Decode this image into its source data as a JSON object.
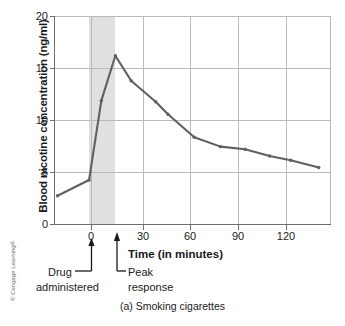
{
  "figure": {
    "caption": "(a) Smoking cigarettes",
    "copyright": "© Cengage Learning®"
  },
  "annotations": {
    "drug_line1": "Drug",
    "drug_line2": "administered",
    "peak_line1": "Peak",
    "peak_line2": "response"
  },
  "colors": {
    "line": "#606060",
    "grid": "#b9b9b9",
    "axis": "#6e6e6e",
    "shade": "#e0e0e0",
    "text": "#1a1a1a"
  },
  "chart_data": {
    "type": "line",
    "title": "(a) Smoking cigarettes",
    "xlabel": "Time (in minutes)",
    "ylabel": "Blood nicotine concentration (ng/ml)",
    "xlim": [
      -20,
      138
    ],
    "ylim": [
      0,
      20
    ],
    "xticks": [
      0,
      30,
      60,
      90,
      120
    ],
    "yticks": [
      0,
      5,
      10,
      15,
      20
    ],
    "xtick_labels": [
      "0",
      "30",
      "60",
      "90",
      "120"
    ],
    "ytick_labels": [
      "0",
      "5",
      "10",
      "15",
      "20"
    ],
    "grid": "both",
    "legend": "none",
    "shaded_region": {
      "label": "smoking period",
      "x_start": 0,
      "x_end": 15
    },
    "series": [
      {
        "name": "Blood nicotine concentration",
        "x": [
          -18,
          0,
          7,
          15,
          24,
          38,
          45,
          60,
          75,
          89,
          103,
          115,
          131
        ],
        "values": [
          2.8,
          4.3,
          11.9,
          16.2,
          13.8,
          11.8,
          10.6,
          8.4,
          7.5,
          7.25,
          6.6,
          6.2,
          5.5
        ]
      }
    ],
    "markers": [
      {
        "name": "Drug administered",
        "x": 0
      },
      {
        "name": "Peak response",
        "x": 15
      }
    ]
  }
}
